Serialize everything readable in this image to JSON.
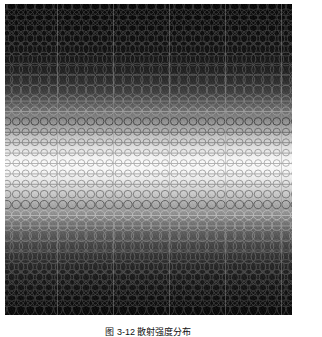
{
  "figure": {
    "caption": "图 3-12  散射强度分布",
    "panel": {
      "background_color": "#000000",
      "page_background_color": "#ffffff",
      "left": 5,
      "top": 4,
      "width": 287,
      "height": 311
    }
  },
  "chart_data": {
    "type": "heatmap",
    "title": "",
    "subtitle": "",
    "xlabel": "",
    "ylabel": "",
    "grid": true,
    "legend": "none",
    "xlim": [
      0,
      287
    ],
    "ylim": [
      0,
      311
    ],
    "lattice": {
      "columns": 31,
      "rows": 30,
      "column_spacing_px": 9.3,
      "row_spacing_px": 10.4,
      "x_origin_px": 2,
      "y_origin_px": 3,
      "ring_stroke_px": 1.0
    },
    "vertical_gridlines_px": [
      52,
      108,
      164,
      220,
      276
    ],
    "gridline_color": "#6a6a6a",
    "gridline_opacity": 0.45,
    "brightness_profile": {
      "axis": "y",
      "note": "Background grey level as a function of row index (0 = top row, 29 = bottom row); 0 = black, 255 = white.",
      "row_index": [
        0,
        1,
        2,
        3,
        4,
        5,
        6,
        7,
        8,
        9,
        10,
        11,
        12,
        13,
        14,
        15,
        16,
        17,
        18,
        19,
        20,
        21,
        22,
        23,
        24,
        25,
        26,
        27,
        28,
        29
      ],
      "grey_level": [
        10,
        12,
        14,
        17,
        20,
        26,
        34,
        46,
        62,
        84,
        112,
        146,
        182,
        212,
        236,
        250,
        243,
        224,
        198,
        168,
        138,
        110,
        86,
        66,
        50,
        38,
        28,
        21,
        16,
        12
      ]
    },
    "ring_radius_profile": {
      "axis": "y",
      "note": "Ring outer radius in pixels per row index; minimum at the bright centre band, maximum at the dark edges.",
      "row_index": [
        0,
        1,
        2,
        3,
        4,
        5,
        6,
        7,
        8,
        9,
        10,
        11,
        12,
        13,
        14,
        15,
        16,
        17,
        18,
        19,
        20,
        21,
        22,
        23,
        24,
        25,
        26,
        27,
        28,
        29
      ],
      "radius_px": [
        9.0,
        8.8,
        8.5,
        8.1,
        7.6,
        7.0,
        6.4,
        5.8,
        5.2,
        4.7,
        4.2,
        3.9,
        3.6,
        3.5,
        3.4,
        3.4,
        3.5,
        3.6,
        3.9,
        4.2,
        4.7,
        5.2,
        5.8,
        6.4,
        7.0,
        7.6,
        8.1,
        8.5,
        8.8,
        9.0
      ]
    },
    "connector_rows": [
      12,
      13,
      14,
      15,
      16,
      17,
      20,
      21,
      9,
      10
    ],
    "ring_color_light": "#b8b8b8",
    "ring_color_dark": "#3a3a3a",
    "accent_color": "#ffffff"
  }
}
